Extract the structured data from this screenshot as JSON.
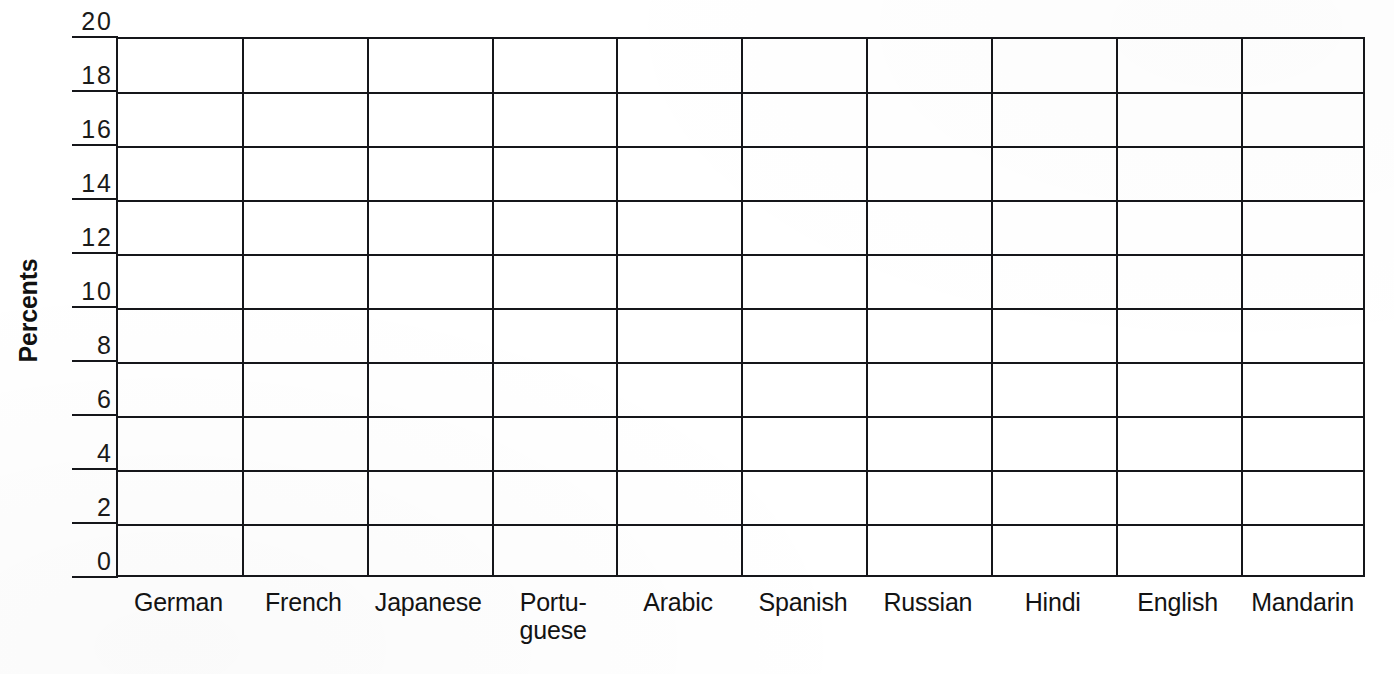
{
  "chart_data": {
    "type": "bar",
    "title": "",
    "subtitle": "",
    "xlabel": "",
    "ylabel": "Percents",
    "categories": [
      "German",
      "French",
      "Japanese",
      "Portu-\nguese",
      "Arabic",
      "Spanish",
      "Russian",
      "Hindi",
      "English",
      "Mandarin"
    ],
    "values": [
      null,
      null,
      null,
      null,
      null,
      null,
      null,
      null,
      null,
      null
    ],
    "ylim": [
      0,
      20
    ],
    "ytick_step": 2,
    "ytick_labels": [
      "0",
      "2",
      "4",
      "6",
      "8",
      "10",
      "12",
      "14",
      "16",
      "18",
      "20"
    ],
    "grid": "horizontal-and-vertical",
    "legend": "none",
    "note": "Blank worksheet grid template; no bars are drawn."
  },
  "axes": {
    "y_title": "Percents",
    "y_ticks": [
      {
        "value": 20,
        "label": "20"
      },
      {
        "value": 18,
        "label": "18"
      },
      {
        "value": 16,
        "label": "16"
      },
      {
        "value": 14,
        "label": "14"
      },
      {
        "value": 12,
        "label": "12"
      },
      {
        "value": 10,
        "label": "10"
      },
      {
        "value": 8,
        "label": "8"
      },
      {
        "value": 6,
        "label": "6"
      },
      {
        "value": 4,
        "label": "4"
      },
      {
        "value": 2,
        "label": "2"
      },
      {
        "value": 0,
        "label": "0"
      }
    ],
    "x_categories": [
      {
        "label": "German",
        "lines": [
          "German"
        ]
      },
      {
        "label": "French",
        "lines": [
          "French"
        ]
      },
      {
        "label": "Japanese",
        "lines": [
          "Japanese"
        ]
      },
      {
        "label": "Portuguese",
        "lines": [
          "Portu-",
          "guese"
        ]
      },
      {
        "label": "Arabic",
        "lines": [
          "Arabic"
        ]
      },
      {
        "label": "Spanish",
        "lines": [
          "Spanish"
        ]
      },
      {
        "label": "Russian",
        "lines": [
          "Russian"
        ]
      },
      {
        "label": "Hindi",
        "lines": [
          "Hindi"
        ]
      },
      {
        "label": "English",
        "lines": [
          "English"
        ]
      },
      {
        "label": "Mandarin",
        "lines": [
          "Mandarin"
        ]
      }
    ]
  },
  "colors": {
    "line": "#15161a",
    "text": "#131313",
    "background": "#ffffff"
  }
}
